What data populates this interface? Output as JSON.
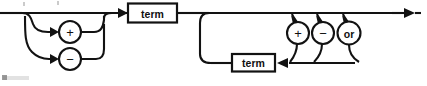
{
  "diagram": {
    "kind": "railroad-syntax-diagram",
    "entry_label": "",
    "exit_label": "",
    "nodes": [
      {
        "id": "sign-plus",
        "icon": "plus-circle",
        "label": "+",
        "shape": "circle",
        "cx": 70,
        "cy": 32,
        "r": 11
      },
      {
        "id": "sign-minus",
        "icon": "minus-circle",
        "label": "−",
        "shape": "circle",
        "cx": 70,
        "cy": 59,
        "r": 11
      },
      {
        "id": "term-first",
        "icon": "term-box",
        "label": "term",
        "shape": "box",
        "x": 128,
        "y": 4,
        "w": 49,
        "h": 19
      },
      {
        "id": "op-plus",
        "icon": "plus-circle",
        "label": "+",
        "shape": "circle",
        "cx": 298,
        "cy": 33,
        "r": 11
      },
      {
        "id": "op-minus",
        "icon": "minus-circle",
        "label": "−",
        "shape": "circle",
        "cx": 323,
        "cy": 33,
        "r": 11
      },
      {
        "id": "op-or",
        "icon": "or-circle",
        "label": "or",
        "shape": "circle",
        "cx": 349,
        "cy": 33,
        "r": 11.5
      },
      {
        "id": "term-second",
        "icon": "term-box",
        "label": "term",
        "shape": "box",
        "x": 232,
        "y": 54,
        "w": 43,
        "h": 17
      }
    ],
    "labels": {
      "term": "term",
      "plus": "+",
      "minus": "−",
      "or": "or"
    },
    "colors": {
      "stroke": "#121212",
      "fill": "#ffffff",
      "background": "#ffffff",
      "text": "#101010"
    }
  }
}
